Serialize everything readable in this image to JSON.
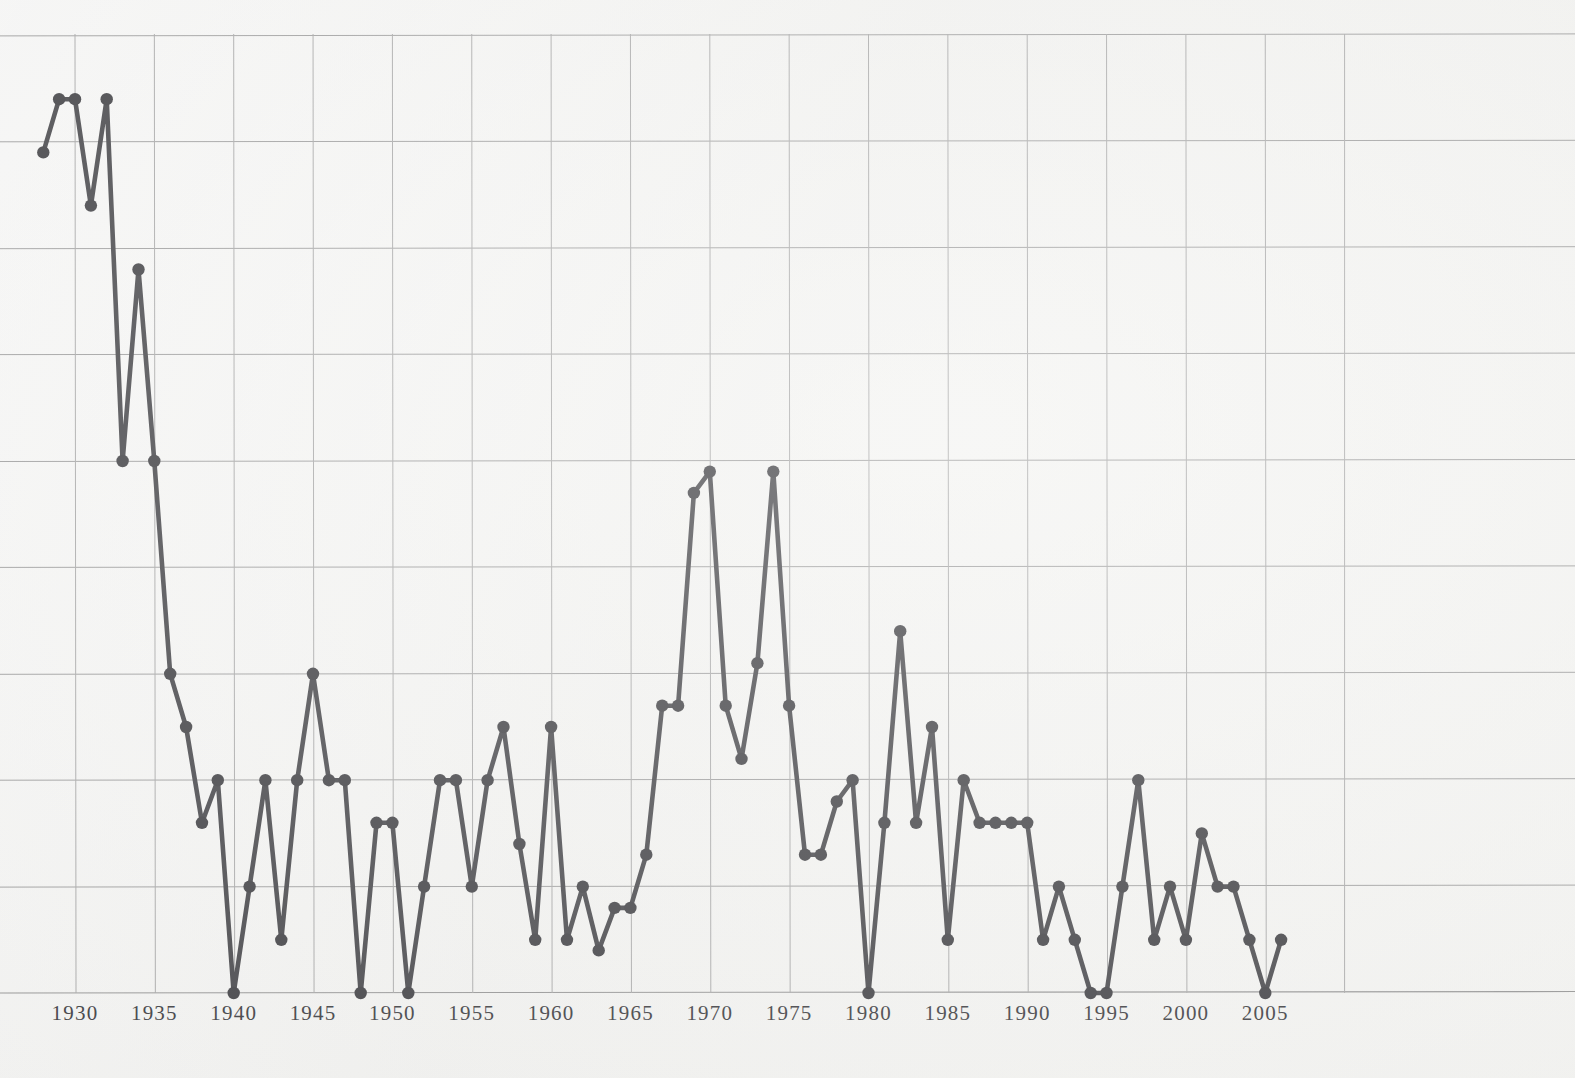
{
  "figure": {
    "kind": "line-graph",
    "paper_background": "#f3f3f1",
    "ink_color": "#343438",
    "gridline_color": "#9a9a9a",
    "has_y_axis_labels": false,
    "has_title": false,
    "has_legend": false
  },
  "chart_data": {
    "type": "line",
    "title": "",
    "subtitle": "",
    "xlabel": "",
    "ylabel": "",
    "grid": true,
    "legend_position": "none",
    "xlim": [
      1928,
      2007
    ],
    "ylim": [
      0,
      9
    ],
    "x_tick_labels": [
      "1930",
      "1935",
      "1940",
      "1945",
      "1950",
      "1955",
      "1960",
      "1965",
      "1970",
      "1975",
      "1980",
      "1985",
      "1990",
      "1995",
      "2000",
      "2005"
    ],
    "x_ticks": [
      1930,
      1935,
      1940,
      1945,
      1950,
      1955,
      1960,
      1965,
      1970,
      1975,
      1980,
      1985,
      1990,
      1995,
      2000,
      2005
    ],
    "y_gridline_values": [
      0,
      1,
      2,
      3,
      4,
      5,
      6,
      7,
      8,
      9
    ],
    "y_tick_labels": [],
    "series": [
      {
        "name": "",
        "marker": "circle",
        "x": [
          1928,
          1929,
          1930,
          1931,
          1932,
          1933,
          1934,
          1935,
          1936,
          1937,
          1938,
          1939,
          1940,
          1941,
          1942,
          1943,
          1944,
          1945,
          1946,
          1947,
          1948,
          1949,
          1950,
          1951,
          1952,
          1953,
          1954,
          1955,
          1956,
          1957,
          1958,
          1959,
          1960,
          1961,
          1962,
          1963,
          1964,
          1965,
          1966,
          1967,
          1968,
          1969,
          1970,
          1971,
          1972,
          1973,
          1974,
          1975,
          1976,
          1977,
          1978,
          1979,
          1980,
          1981,
          1982,
          1983,
          1984,
          1985,
          1986,
          1987,
          1988,
          1989,
          1990,
          1991,
          1992,
          1993,
          1994,
          1995,
          1996,
          1997,
          1998,
          1999,
          2000,
          2001,
          2002,
          2003,
          2004,
          2005,
          2006
        ],
        "values": [
          7.9,
          8.4,
          8.4,
          7.4,
          8.4,
          5.0,
          6.8,
          5.0,
          3.0,
          2.5,
          1.6,
          2.0,
          0.0,
          1.0,
          2.0,
          0.5,
          2.0,
          3.0,
          2.0,
          2.0,
          0.0,
          1.6,
          1.6,
          0.0,
          1.0,
          2.0,
          2.0,
          1.0,
          2.0,
          2.5,
          1.4,
          0.5,
          2.5,
          0.5,
          1.0,
          0.4,
          0.8,
          0.8,
          1.3,
          2.7,
          2.7,
          4.7,
          4.9,
          2.7,
          2.2,
          3.1,
          4.9,
          2.7,
          1.3,
          1.3,
          1.8,
          2.0,
          0.0,
          1.6,
          3.4,
          1.6,
          2.5,
          0.5,
          2.0,
          1.6,
          1.6,
          1.6,
          1.6,
          0.5,
          1.0,
          0.5,
          0.0,
          0.0,
          1.0,
          2.0,
          0.5,
          1.0,
          0.5,
          1.5,
          1.0,
          1.0,
          0.5,
          0.0,
          0.5
        ]
      }
    ]
  },
  "axis": {
    "x_axis_label_text": "",
    "y_axis_label_text": ""
  }
}
